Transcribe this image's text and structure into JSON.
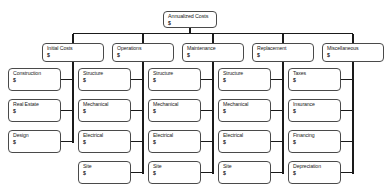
{
  "diagram": {
    "type": "tree",
    "currency_symbol": "$",
    "colors": {
      "background": "#ffffff",
      "box_border": "#4a4a4a",
      "connector": "#1a1a1a",
      "text": "#1a1a1a"
    },
    "root": {
      "label": "Annualized Costs",
      "amount": "$"
    },
    "branches": [
      {
        "label": "Initial Costs",
        "amount": "$",
        "children": [
          {
            "label": "Construction",
            "amount": "$"
          },
          {
            "label": "Real Estate",
            "amount": "$"
          },
          {
            "label": "Design",
            "amount": "$"
          }
        ]
      },
      {
        "label": "Operations",
        "amount": "$",
        "children": [
          {
            "label": "Structure",
            "amount": "$"
          },
          {
            "label": "Mechanical",
            "amount": "$"
          },
          {
            "label": "Electrical",
            "amount": "$"
          },
          {
            "label": "Site",
            "amount": "$"
          }
        ]
      },
      {
        "label": "Maintenance",
        "amount": "$",
        "children": [
          {
            "label": "Structure",
            "amount": "$"
          },
          {
            "label": "Mechanical",
            "amount": "$"
          },
          {
            "label": "Electrical",
            "amount": "$"
          },
          {
            "label": "Site",
            "amount": "$"
          }
        ]
      },
      {
        "label": "Replacement",
        "amount": "$",
        "children": [
          {
            "label": "Structure",
            "amount": "$"
          },
          {
            "label": "Mechanical",
            "amount": "$"
          },
          {
            "label": "Electrical",
            "amount": "$"
          },
          {
            "label": "Site",
            "amount": "$"
          }
        ]
      },
      {
        "label": "Miscellaneous",
        "amount": "$",
        "children": [
          {
            "label": "Taxes",
            "amount": "$"
          },
          {
            "label": "Insurance",
            "amount": "$"
          },
          {
            "label": "Financing",
            "amount": "$"
          },
          {
            "label": "Depreciation",
            "amount": "$"
          }
        ]
      }
    ]
  }
}
